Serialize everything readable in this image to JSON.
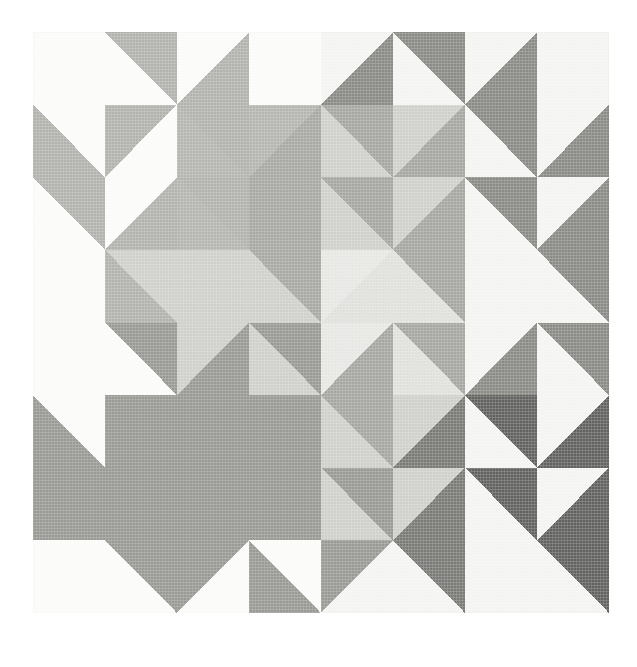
{
  "figure": {
    "background_color": "#ffffff",
    "panel_background": "#fbfbfa",
    "panel": {
      "x": 33,
      "y": 32,
      "width": 576,
      "height": 581
    },
    "grid": {
      "rows": 4,
      "columns": 4,
      "cell_width": 144,
      "cell_height": 145.25
    }
  },
  "palette": {
    "white": "#fbfbfa",
    "offwhite": "#f4f4f2",
    "pale": "#e7e7e4",
    "light": "#dcdcd9",
    "light_mid": "#cfcfcb",
    "mid": "#bdbdb9",
    "mid_gray": "#b2b2ae",
    "medium": "#a6a6a2",
    "medium_dark": "#999995",
    "dark": "#8a8a86",
    "darker": "#7a7a77",
    "darkest": "#626260"
  },
  "blocks": [
    {
      "row": 0,
      "column": 0,
      "name": "block-r0c0",
      "motif": "sawtooth-star-pale",
      "quadrants": [
        {
          "name": "q-top-left",
          "kind": "half-square-triangle",
          "orientation": "tl-br",
          "colors": [
            "#fbfbfa",
            "#fbfbfa"
          ]
        },
        {
          "name": "q-top-right",
          "kind": "half-square-triangle",
          "orientation": "bl-tr",
          "colors": [
            "#b2b2ae",
            "#fbfbfa"
          ]
        },
        {
          "name": "q-bottom-left",
          "kind": "half-square-triangle",
          "orientation": "bl-tr",
          "colors": [
            "#fbfbfa",
            "#b2b2ae"
          ]
        },
        {
          "name": "q-bottom-right",
          "kind": "half-square-triangle",
          "orientation": "tl-br",
          "colors": [
            "#b2b2ae",
            "#fbfbfa"
          ]
        }
      ]
    },
    {
      "row": 0,
      "column": 1,
      "name": "block-r0c1",
      "motif": "star-point-pale",
      "quadrants": [
        {
          "name": "q-top-left",
          "kind": "half-square-triangle",
          "orientation": "tl-br",
          "colors": [
            "#fbfbfa",
            "#b2b2ae"
          ]
        },
        {
          "name": "q-top-right",
          "kind": "half-square-triangle",
          "orientation": "bl-tr",
          "colors": [
            "#fbfbfa",
            "#fbfbfa"
          ]
        },
        {
          "name": "q-bottom-left",
          "kind": "half-square-triangle",
          "orientation": "bl-tr",
          "colors": [
            "#b2b2ae",
            "#b5b5b1"
          ]
        },
        {
          "name": "q-bottom-right",
          "kind": "half-square-triangle",
          "orientation": "tl-br",
          "colors": [
            "#b5b5b1",
            "#a8a8a4"
          ]
        }
      ]
    },
    {
      "row": 0,
      "column": 2,
      "name": "block-r0c2",
      "motif": "star-point-medium",
      "quadrants": [
        {
          "name": "q-top-left",
          "kind": "half-square-triangle",
          "orientation": "tl-br",
          "colors": [
            "#f4f4f2",
            "#8a8a86"
          ]
        },
        {
          "name": "q-top-right",
          "kind": "half-square-triangle",
          "orientation": "bl-tr",
          "colors": [
            "#8a8a86",
            "#f4f4f2"
          ]
        },
        {
          "name": "q-bottom-left",
          "kind": "half-square-triangle",
          "orientation": "bl-tr",
          "colors": [
            "#a6a6a2",
            "#cfcfcb"
          ]
        },
        {
          "name": "q-bottom-right",
          "kind": "half-square-triangle",
          "orientation": "tl-br",
          "colors": [
            "#cfcfcb",
            "#a6a6a2"
          ]
        }
      ]
    },
    {
      "row": 0,
      "column": 3,
      "name": "block-r0c3",
      "motif": "sawtooth-star-medium",
      "quadrants": [
        {
          "name": "q-top-left",
          "kind": "half-square-triangle",
          "orientation": "tl-br",
          "colors": [
            "#f4f4f2",
            "#8a8a86"
          ]
        },
        {
          "name": "q-top-right",
          "kind": "half-square-triangle",
          "orientation": "bl-tr",
          "colors": [
            "#f4f4f2",
            "#f4f4f2"
          ]
        },
        {
          "name": "q-bottom-left",
          "kind": "half-square-triangle",
          "orientation": "bl-tr",
          "colors": [
            "#8a8a86",
            "#f4f4f2"
          ]
        },
        {
          "name": "q-bottom-right",
          "kind": "half-square-triangle",
          "orientation": "tl-br",
          "colors": [
            "#f4f4f2",
            "#8a8a86"
          ]
        }
      ]
    },
    {
      "row": 1,
      "column": 0,
      "name": "block-r1c0",
      "motif": "star-point-pale-left",
      "quadrants": [
        {
          "name": "q-top-left",
          "kind": "half-square-triangle",
          "orientation": "bl-tr",
          "colors": [
            "#b2b2ae",
            "#fbfbfa"
          ]
        },
        {
          "name": "q-top-right",
          "kind": "half-square-triangle",
          "orientation": "tl-br",
          "colors": [
            "#fbfbfa",
            "#b2b2ae"
          ]
        },
        {
          "name": "q-bottom-left",
          "kind": "half-square-triangle",
          "orientation": "tl-br",
          "colors": [
            "#fbfbfa",
            "#fbfbfa"
          ]
        },
        {
          "name": "q-bottom-right",
          "kind": "half-square-triangle",
          "orientation": "bl-tr",
          "colors": [
            "#cfcfcb",
            "#b2b2ae"
          ]
        }
      ]
    },
    {
      "row": 1,
      "column": 1,
      "name": "block-r1c1",
      "motif": "center-square-light",
      "quadrants": [
        {
          "name": "q-top-left",
          "kind": "half-square-triangle",
          "orientation": "bl-tr",
          "colors": [
            "#b2b2ae",
            "#b5b5b1"
          ]
        },
        {
          "name": "q-top-right",
          "kind": "half-square-triangle",
          "orientation": "tl-br",
          "colors": [
            "#a8a8a4",
            "#a8a8a4"
          ]
        },
        {
          "name": "q-bottom-left",
          "kind": "half-square-triangle",
          "orientation": "tl-br",
          "colors": [
            "#cfcfcb",
            "#cfcfcb"
          ]
        },
        {
          "name": "q-bottom-right",
          "kind": "half-square-triangle",
          "orientation": "bl-tr",
          "colors": [
            "#a8a8a4",
            "#cfcfcb"
          ]
        }
      ]
    },
    {
      "row": 1,
      "column": 2,
      "name": "block-r1c2",
      "motif": "center-square-pale",
      "quadrants": [
        {
          "name": "q-top-left",
          "kind": "half-square-triangle",
          "orientation": "bl-tr",
          "colors": [
            "#a6a6a2",
            "#cfcfcb"
          ]
        },
        {
          "name": "q-top-right",
          "kind": "half-square-triangle",
          "orientation": "tl-br",
          "colors": [
            "#cfcfcb",
            "#a6a6a2"
          ]
        },
        {
          "name": "q-bottom-left",
          "kind": "half-square-triangle",
          "orientation": "tl-br",
          "colors": [
            "#e7e7e4",
            "#e0e0dd"
          ]
        },
        {
          "name": "q-bottom-right",
          "kind": "half-square-triangle",
          "orientation": "bl-tr",
          "colors": [
            "#a6a6a2",
            "#e0e0dd"
          ]
        }
      ]
    },
    {
      "row": 1,
      "column": 3,
      "name": "block-r1c3",
      "motif": "sawtooth-star-medium-lower",
      "quadrants": [
        {
          "name": "q-top-left",
          "kind": "half-square-triangle",
          "orientation": "bl-tr",
          "colors": [
            "#8a8a86",
            "#f4f4f2"
          ]
        },
        {
          "name": "q-top-right",
          "kind": "half-square-triangle",
          "orientation": "tl-br",
          "colors": [
            "#f4f4f2",
            "#8a8a86"
          ]
        },
        {
          "name": "q-bottom-left",
          "kind": "half-square-triangle",
          "orientation": "tl-br",
          "colors": [
            "#f4f4f2",
            "#f4f4f2"
          ]
        },
        {
          "name": "q-bottom-right",
          "kind": "half-square-triangle",
          "orientation": "bl-tr",
          "colors": [
            "#8a8a86",
            "#f4f4f2"
          ]
        }
      ]
    },
    {
      "row": 2,
      "column": 0,
      "name": "block-r2c0",
      "motif": "sawtooth-star-dark-upper",
      "quadrants": [
        {
          "name": "q-top-left",
          "kind": "half-square-triangle",
          "orientation": "tl-br",
          "colors": [
            "#fbfbfa",
            "#fbfbfa"
          ]
        },
        {
          "name": "q-top-right",
          "kind": "half-square-triangle",
          "orientation": "bl-tr",
          "colors": [
            "#999995",
            "#fbfbfa"
          ]
        },
        {
          "name": "q-bottom-left",
          "kind": "half-square-triangle",
          "orientation": "bl-tr",
          "colors": [
            "#fbfbfa",
            "#999995"
          ]
        },
        {
          "name": "q-bottom-right",
          "kind": "half-square-triangle",
          "orientation": "tl-br",
          "colors": [
            "#999995",
            "#999995"
          ]
        }
      ]
    },
    {
      "row": 2,
      "column": 1,
      "name": "block-r2c1",
      "motif": "star-point-dark",
      "quadrants": [
        {
          "name": "q-top-left",
          "kind": "half-square-triangle",
          "orientation": "tl-br",
          "colors": [
            "#cfcfcb",
            "#999995"
          ]
        },
        {
          "name": "q-top-right",
          "kind": "half-square-triangle",
          "orientation": "bl-tr",
          "colors": [
            "#999995",
            "#cfcfcb"
          ]
        },
        {
          "name": "q-bottom-left",
          "kind": "half-square-triangle",
          "orientation": "bl-tr",
          "colors": [
            "#999995",
            "#999995"
          ]
        },
        {
          "name": "q-bottom-right",
          "kind": "half-square-triangle",
          "orientation": "tl-br",
          "colors": [
            "#999995",
            "#999995"
          ]
        }
      ]
    },
    {
      "row": 2,
      "column": 2,
      "name": "block-r2c2",
      "motif": "star-point-mixed",
      "quadrants": [
        {
          "name": "q-top-left",
          "kind": "half-square-triangle",
          "orientation": "tl-br",
          "colors": [
            "#e7e7e4",
            "#a6a6a2"
          ]
        },
        {
          "name": "q-top-right",
          "kind": "half-square-triangle",
          "orientation": "bl-tr",
          "colors": [
            "#a6a6a2",
            "#e0e0dd"
          ]
        },
        {
          "name": "q-bottom-left",
          "kind": "half-square-triangle",
          "orientation": "bl-tr",
          "colors": [
            "#a6a6a2",
            "#cfcfcb"
          ]
        },
        {
          "name": "q-bottom-right",
          "kind": "half-square-triangle",
          "orientation": "tl-br",
          "colors": [
            "#cfcfcb",
            "#7a7a77"
          ]
        }
      ]
    },
    {
      "row": 2,
      "column": 3,
      "name": "block-r2c3",
      "motif": "sawtooth-star-darkest-upper",
      "quadrants": [
        {
          "name": "q-top-left",
          "kind": "half-square-triangle",
          "orientation": "tl-br",
          "colors": [
            "#f4f4f2",
            "#8a8a86"
          ]
        },
        {
          "name": "q-top-right",
          "kind": "half-square-triangle",
          "orientation": "bl-tr",
          "colors": [
            "#8a8a86",
            "#f4f4f2"
          ]
        },
        {
          "name": "q-bottom-left",
          "kind": "half-square-triangle",
          "orientation": "bl-tr",
          "colors": [
            "#626260",
            "#f4f4f2"
          ]
        },
        {
          "name": "q-bottom-right",
          "kind": "half-square-triangle",
          "orientation": "tl-br",
          "colors": [
            "#f4f4f2",
            "#626260"
          ]
        }
      ]
    },
    {
      "row": 3,
      "column": 0,
      "name": "block-r3c0",
      "motif": "sawtooth-star-dark-lower",
      "quadrants": [
        {
          "name": "q-top-left",
          "kind": "half-square-triangle",
          "orientation": "bl-tr",
          "colors": [
            "#999995",
            "#999995"
          ]
        },
        {
          "name": "q-top-right",
          "kind": "half-square-triangle",
          "orientation": "tl-br",
          "colors": [
            "#999995",
            "#999995"
          ]
        },
        {
          "name": "q-bottom-left",
          "kind": "half-square-triangle",
          "orientation": "tl-br",
          "colors": [
            "#fbfbfa",
            "#fbfbfa"
          ]
        },
        {
          "name": "q-bottom-right",
          "kind": "half-square-triangle",
          "orientation": "bl-tr",
          "colors": [
            "#999995",
            "#fbfbfa"
          ]
        }
      ]
    },
    {
      "row": 3,
      "column": 1,
      "name": "block-r3c1",
      "motif": "star-point-dark-lower",
      "quadrants": [
        {
          "name": "q-top-left",
          "kind": "half-square-triangle",
          "orientation": "bl-tr",
          "colors": [
            "#999995",
            "#999995"
          ]
        },
        {
          "name": "q-top-right",
          "kind": "half-square-triangle",
          "orientation": "tl-br",
          "colors": [
            "#999995",
            "#999995"
          ]
        },
        {
          "name": "q-bottom-left",
          "kind": "half-square-triangle",
          "orientation": "tl-br",
          "colors": [
            "#999995",
            "#fbfbfa"
          ]
        },
        {
          "name": "q-bottom-right",
          "kind": "half-square-triangle",
          "orientation": "bl-tr",
          "colors": [
            "#fbfbfa",
            "#999995"
          ]
        }
      ]
    },
    {
      "row": 3,
      "column": 2,
      "name": "block-r3c2",
      "motif": "center-square-pale-lower",
      "quadrants": [
        {
          "name": "q-top-left",
          "kind": "half-square-triangle",
          "orientation": "bl-tr",
          "colors": [
            "#999995",
            "#cfcfcb"
          ]
        },
        {
          "name": "q-top-right",
          "kind": "half-square-triangle",
          "orientation": "tl-br",
          "colors": [
            "#cfcfcb",
            "#7a7a77"
          ]
        },
        {
          "name": "q-bottom-left",
          "kind": "half-square-triangle",
          "orientation": "tl-br",
          "colors": [
            "#999995",
            "#f4f4f2"
          ]
        },
        {
          "name": "q-bottom-right",
          "kind": "half-square-triangle",
          "orientation": "bl-tr",
          "colors": [
            "#7a7a77",
            "#f4f4f2"
          ]
        }
      ]
    },
    {
      "row": 3,
      "column": 3,
      "name": "block-r3c3",
      "motif": "sawtooth-star-darkest-lower",
      "quadrants": [
        {
          "name": "q-top-left",
          "kind": "half-square-triangle",
          "orientation": "bl-tr",
          "colors": [
            "#626260",
            "#f4f4f2"
          ]
        },
        {
          "name": "q-top-right",
          "kind": "half-square-triangle",
          "orientation": "tl-br",
          "colors": [
            "#f4f4f2",
            "#626260"
          ]
        },
        {
          "name": "q-bottom-left",
          "kind": "half-square-triangle",
          "orientation": "tl-br",
          "colors": [
            "#f4f4f2",
            "#f4f4f2"
          ]
        },
        {
          "name": "q-bottom-right",
          "kind": "half-square-triangle",
          "orientation": "bl-tr",
          "colors": [
            "#626260",
            "#f4f4f2"
          ]
        }
      ]
    }
  ]
}
